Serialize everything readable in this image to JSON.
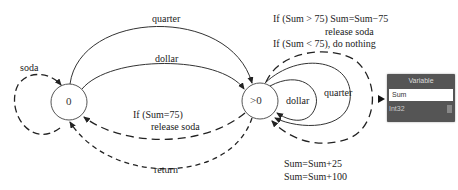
{
  "diagram": {
    "states": [
      {
        "id": "zero",
        "label": "0"
      },
      {
        "id": "positive",
        "label": ">0"
      }
    ],
    "transitions": {
      "soda": "soda",
      "quarter_top": "quarter",
      "dollar_top": "dollar",
      "release": [
        "If (Sum=75)",
        "release soda"
      ],
      "return": "return",
      "self_dollar": "dollar",
      "self_quarter": "quarter"
    },
    "conditions": [
      "If (Sum > 75) Sum=Sum−75",
      "release soda",
      "If (Sum < 75),  do nothing"
    ],
    "actions": [
      "Sum=Sum+25",
      "Sum=Sum+100"
    ]
  },
  "variable_widget": {
    "title": "Variable",
    "name": "Sum",
    "type": "Int32"
  }
}
